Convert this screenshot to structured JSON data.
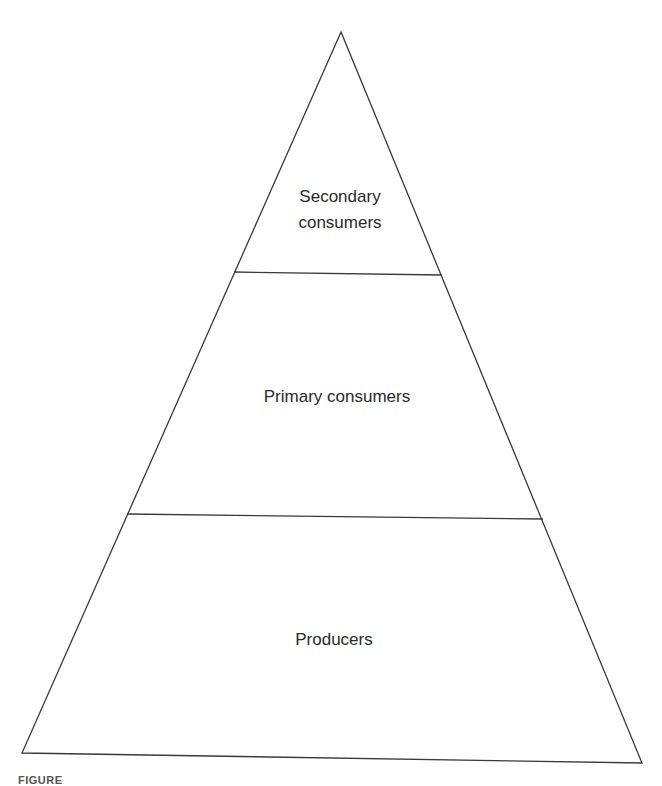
{
  "diagram": {
    "type": "ecological-pyramid",
    "colors": {
      "stroke": "#3a3a3a",
      "text": "#2a2a2a",
      "background": "#ffffff"
    },
    "levels": [
      {
        "id": "secondary",
        "label_lines": [
          "Secondary",
          "consumers"
        ]
      },
      {
        "id": "primary",
        "label_lines": [
          "Primary consumers"
        ]
      },
      {
        "id": "producers",
        "label_lines": [
          "Producers"
        ]
      }
    ]
  },
  "caption": {
    "text": "FIGURE"
  }
}
